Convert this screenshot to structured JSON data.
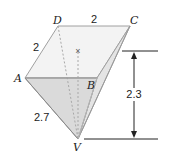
{
  "figure": {
    "type": "pyramid-diagram",
    "vertices": {
      "A": {
        "label": "A",
        "x": 25,
        "y": 78
      },
      "B": {
        "label": "B",
        "x": 97,
        "y": 78
      },
      "C": {
        "label": "C",
        "x": 130,
        "y": 26
      },
      "D": {
        "label": "D",
        "x": 58,
        "y": 26
      },
      "V": {
        "label": "V",
        "x": 78,
        "y": 139
      }
    },
    "center_mark": {
      "symbol": "×",
      "x": 78,
      "y": 50
    },
    "measurements": {
      "DC": "2",
      "AD": "2",
      "AV": "2.7",
      "height": "2.3"
    },
    "colors": {
      "base_face": "#f2f2f2",
      "front_face": "#dcdcdc",
      "side_face": "#e8e8e8",
      "edge": "#9a9a9a",
      "hidden_edge": "#b0b0b0",
      "dimension_line": "#222222"
    }
  }
}
